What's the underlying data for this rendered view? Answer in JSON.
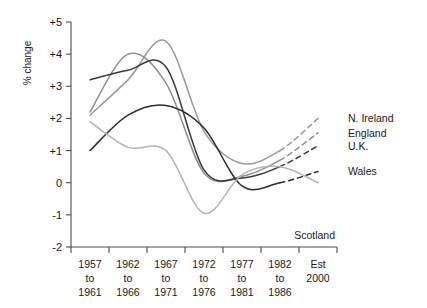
{
  "chart_data": {
    "type": "line",
    "title": "",
    "xlabel": "",
    "ylabel": "% change",
    "ylim": [
      -2,
      5
    ],
    "yticks": [
      "+5",
      "+4",
      "+3",
      "+2",
      "+1",
      "0",
      "-1",
      "-2"
    ],
    "ytick_values": [
      5,
      4,
      3,
      2,
      1,
      0,
      -1,
      -2
    ],
    "grid": false,
    "legend_position": "right-inline",
    "categories": [
      "1957 to 1961",
      "1962 to 1966",
      "1967 to 1971",
      "1972 to 1976",
      "1977 to 1981",
      "1982 to 1986",
      "Est 2000"
    ],
    "categories_lines": [
      [
        "1957",
        "to",
        "1961"
      ],
      [
        "1962",
        "to",
        "1966"
      ],
      [
        "1967",
        "to",
        "1971"
      ],
      [
        "1972",
        "to",
        "1976"
      ],
      [
        "1977",
        "to",
        "1981"
      ],
      [
        "1982",
        "to",
        "1986"
      ],
      [
        "Est",
        "2000"
      ]
    ],
    "forecast_from_index": 5,
    "series": [
      {
        "name": "N. Ireland",
        "color": "#9a9a9a",
        "values": [
          2.1,
          3.2,
          4.4,
          1.6,
          0.6,
          1.0,
          2.0
        ]
      },
      {
        "name": "England",
        "color": "#8f8f8f",
        "values": [
          2.2,
          4.0,
          3.1,
          0.3,
          0.2,
          0.7,
          1.55
        ]
      },
      {
        "name": "U.K.",
        "color": "#3a3a3a",
        "values": [
          3.2,
          3.5,
          3.6,
          0.4,
          0.15,
          0.5,
          1.15
        ]
      },
      {
        "name": "Wales",
        "color": "#2e2e2e",
        "values": [
          1.0,
          2.1,
          2.4,
          1.7,
          -0.1,
          0.0,
          0.35
        ]
      },
      {
        "name": "Scotland",
        "color": "#b5b5b5",
        "values": [
          1.9,
          1.1,
          1.0,
          -0.95,
          0.25,
          0.5,
          0.0
        ]
      }
    ],
    "inline_labels": [
      {
        "name": "N. Ireland",
        "y": 2.0
      },
      {
        "name": "England",
        "y": 1.55
      },
      {
        "name": "U.K.",
        "y": 1.15
      },
      {
        "name": "Wales",
        "y": 0.35
      }
    ],
    "floating_label": {
      "name": "Scotland"
    }
  }
}
